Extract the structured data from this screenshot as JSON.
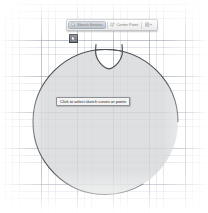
{
  "app": {
    "kind": "cad-sketch-canvas",
    "background_color": "#ffffff",
    "grid_line_color": "#7882915f",
    "grid_major_color": "#6e788c57"
  },
  "toolbar": {
    "name": "sketch-context-toolbar",
    "buttons": [
      {
        "id": "sketch-entities",
        "label": "Sketch Entities",
        "icon": "cursor-arrow-icon",
        "active": true
      },
      {
        "id": "center-point",
        "label": "Center Point",
        "icon": "center-point-icon",
        "active": false
      },
      {
        "id": "options",
        "label": "",
        "icon": "options-dropdown-icon",
        "active": false
      }
    ]
  },
  "tooltip": {
    "name": "selection-hint-tooltip",
    "text": "Click to select sketch curves or points"
  },
  "sketch": {
    "name": "notched-circle-profile",
    "fill_color": "#d7d8d9",
    "stroke_color": "#4c5157",
    "circle": {
      "cx": 105.5,
      "cy": 122,
      "r": 72.5
    },
    "notch": {
      "name": "u-notch",
      "left_x": 96,
      "right_x": 122,
      "depth_y": 57,
      "top_y": 50
    },
    "selection_handle": {
      "name": "selected-point-handle",
      "x": 73.5,
      "y": 38.5,
      "color": "#7a7f87"
    }
  }
}
